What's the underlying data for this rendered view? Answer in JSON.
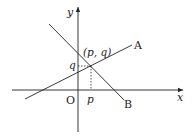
{
  "diagram": {
    "type": "coordinate-plane-two-lines",
    "colors": {
      "stroke": "#222222",
      "background": "#ffffff"
    },
    "axes": {
      "x_label": "x",
      "y_label": "y",
      "origin_label": "O"
    },
    "lines": [
      {
        "name": "A",
        "label": "A",
        "slope": "positive"
      },
      {
        "name": "B",
        "label": "B",
        "slope": "negative"
      }
    ],
    "intersection": {
      "label": "(p, q)",
      "x_label": "p",
      "y_label": "q"
    }
  }
}
